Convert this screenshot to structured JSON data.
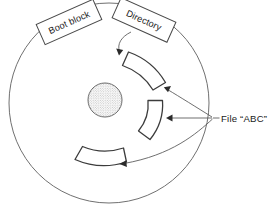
{
  "figure": {
    "kind": "disk-layout-diagram",
    "background_color": "#ffffff",
    "line_color": "#4a4a4a",
    "accent_color": "#2b2b2b"
  },
  "disk": {
    "name": "disk-platter",
    "center_x": 109,
    "center_y": 103,
    "radius": 100,
    "hub": {
      "name": "disk-hub",
      "center_x": 105,
      "center_y": 100,
      "radius": 17,
      "fill_pattern": "stipple-dots"
    }
  },
  "callouts": [
    {
      "id": "boot-block",
      "label": "Boot block",
      "rotation_deg": -24,
      "x": 38,
      "y": 11,
      "width": 62,
      "height": 22
    },
    {
      "id": "directory",
      "label": "Directory",
      "rotation_deg": 24,
      "x": 114,
      "y": 9,
      "width": 60,
      "height": 22
    }
  ],
  "file_label": {
    "name": "file-abc-label",
    "text": "File “ABC”",
    "x": 221,
    "y": 122,
    "anchor_x": 213,
    "anchor_y": 118
  },
  "file_blocks": [
    {
      "id": "file-block-upper",
      "position": "upper-right-arc"
    },
    {
      "id": "file-block-middle",
      "position": "right-arc"
    },
    {
      "id": "file-block-lower",
      "position": "lower-left-arc"
    }
  ],
  "arrows": {
    "directory_to_block": "curved-arrow-down-left",
    "file_to_upper_block": "curved-arrow-left",
    "file_to_middle_block": "straight-arrow-left",
    "file_to_lower_block": "curved-arrow-down-left"
  }
}
